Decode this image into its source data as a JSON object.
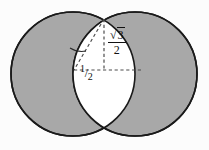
{
  "figure": {
    "name": "two-overlapping-circles-vesica-piscis",
    "caption": "",
    "background_color": "#fcfcfc",
    "shaded_color": "#a8a8a8",
    "lens_color": "#ffffff",
    "stroke_color": "#1a1a1a",
    "dash_color": "#4d4d4d"
  },
  "geometry": {
    "left_circle": {
      "cx": 73,
      "cy": 74,
      "r": 62
    },
    "right_circle": {
      "cx": 135,
      "cy": 74,
      "r": 62
    },
    "top_intersection": {
      "x": 104,
      "y": 18
    },
    "bottom_intersection": {
      "x": 104,
      "y": 130
    },
    "center_line_y": 70,
    "horizontal_dash": {
      "x1": 74,
      "x2": 141,
      "y": 70
    },
    "vertical_dash": {
      "x": 104,
      "y1": 19,
      "y2": 71
    },
    "diagonal_dash": {
      "x1": 104,
      "y1": 19,
      "x2": 74,
      "y2": 70
    },
    "angle_arc": {
      "cx": 74,
      "cy": 70,
      "r": 22
    }
  },
  "labels": {
    "height_label": {
      "name": "sqrt3-over-2-label",
      "numerator": "3",
      "radical": "√",
      "denominator": "2",
      "full_text": "√3/2",
      "x": 110,
      "y": 37
    },
    "half_label": {
      "name": "one-half-label",
      "numerator": "1",
      "slash": "/",
      "denominator": "2",
      "full_text": "1/2",
      "x": 83,
      "y": 73
    }
  }
}
